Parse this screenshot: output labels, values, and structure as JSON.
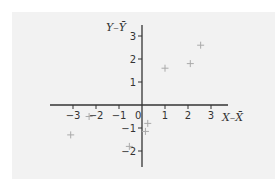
{
  "chart_data": {
    "type": "scatter",
    "title": "",
    "xlabel": "X–X̄",
    "ylabel": "Y–Ȳ",
    "xlim": [
      -4,
      3.7
    ],
    "ylim": [
      -2.7,
      3.5
    ],
    "xticks": [
      -3,
      -2,
      -1,
      0,
      1,
      2,
      3
    ],
    "yticks": [
      -2,
      -1,
      1,
      2,
      3
    ],
    "grid": false,
    "legend": null,
    "marker": "+",
    "colors": {
      "background": "#f2f2f2",
      "axis": "#333333",
      "marker": "#aaaaaa"
    },
    "points": [
      {
        "x": -3.1,
        "y": -1.3
      },
      {
        "x": -2.3,
        "y": -0.5
      },
      {
        "x": -0.55,
        "y": -1.8
      },
      {
        "x": 0.15,
        "y": -1.15
      },
      {
        "x": 0.25,
        "y": -0.8
      },
      {
        "x": 1.0,
        "y": 1.6
      },
      {
        "x": 2.1,
        "y": 1.8
      },
      {
        "x": 2.55,
        "y": 2.6
      }
    ]
  }
}
